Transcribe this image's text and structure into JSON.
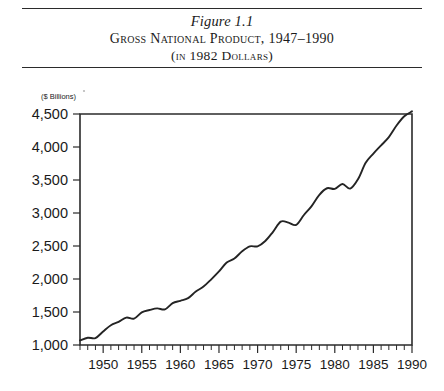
{
  "figure": {
    "number": "Figure 1.1",
    "title": "Gross National Product, 1947–1990",
    "subtitle": "(in 1982 Dollars)"
  },
  "chart_data": {
    "type": "line",
    "title": "Gross National Product, 1947–1990",
    "subtitle": "(in 1982 Dollars)",
    "xlabel": "",
    "ylabel": "($ Billions)",
    "unit_label": "($ Billions)",
    "xlim": [
      1947,
      1990
    ],
    "ylim": [
      1000,
      4500
    ],
    "ytick_labels": [
      "4,500",
      "4,000",
      "3,500",
      "3,000",
      "2,500",
      "2,000",
      "1,500",
      "1,000"
    ],
    "yticks": [
      4500,
      4000,
      3500,
      3000,
      2500,
      2000,
      1500,
      1000
    ],
    "xtick_labels": [
      "1950",
      "1955",
      "1960",
      "1965",
      "1970",
      "1975",
      "1980",
      "1985",
      "1990"
    ],
    "xticks": [
      1950,
      1955,
      1960,
      1965,
      1970,
      1975,
      1980,
      1985,
      1990
    ],
    "minor_xtick_interval": 1,
    "grid": false,
    "legend": null,
    "line_color": "#242424",
    "x": [
      1947,
      1948,
      1949,
      1950,
      1951,
      1952,
      1953,
      1954,
      1955,
      1956,
      1957,
      1958,
      1959,
      1960,
      1961,
      1962,
      1963,
      1964,
      1965,
      1966,
      1967,
      1968,
      1969,
      1970,
      1971,
      1972,
      1973,
      1974,
      1975,
      1976,
      1977,
      1978,
      1979,
      1980,
      1981,
      1982,
      1983,
      1984,
      1985,
      1986,
      1987,
      1988,
      1989,
      1990
    ],
    "values": [
      1070,
      1110,
      1105,
      1205,
      1300,
      1350,
      1415,
      1400,
      1495,
      1530,
      1555,
      1540,
      1635,
      1670,
      1710,
      1810,
      1885,
      1995,
      2115,
      2250,
      2310,
      2420,
      2495,
      2495,
      2575,
      2715,
      2870,
      2855,
      2820,
      2970,
      3105,
      3275,
      3375,
      3365,
      3440,
      3370,
      3510,
      3760,
      3900,
      4025,
      4150,
      4325,
      4465,
      4540
    ],
    "series": [
      {
        "name": "Gross National Product (1982 dollars)",
        "values": [
          1070,
          1110,
          1105,
          1205,
          1300,
          1350,
          1415,
          1400,
          1495,
          1530,
          1555,
          1540,
          1635,
          1670,
          1710,
          1810,
          1885,
          1995,
          2115,
          2250,
          2310,
          2420,
          2495,
          2495,
          2575,
          2715,
          2870,
          2855,
          2820,
          2970,
          3105,
          3275,
          3375,
          3365,
          3440,
          3370,
          3510,
          3760,
          3900,
          4025,
          4150,
          4325,
          4465,
          4540
        ]
      }
    ]
  }
}
